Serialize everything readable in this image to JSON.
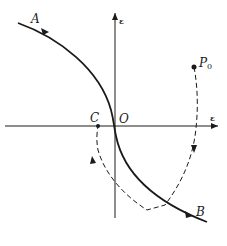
{
  "diagram": {
    "type": "phase-plane trajectory sketch",
    "axes": {
      "horizontal_label": "ε",
      "vertical_label": "ε"
    },
    "points": {
      "origin_label": "O",
      "c_label": "C",
      "p0_label": "P",
      "p0_subscript": "0"
    },
    "curve": {
      "start_label": "A",
      "end_label": "B",
      "style": "solid"
    },
    "trajectory": {
      "style": "dashed",
      "description": "path from P0 down through the switching curve, corner, then back to C"
    },
    "colors": {
      "ink": "#1a1a1a",
      "background": "#ffffff"
    }
  }
}
